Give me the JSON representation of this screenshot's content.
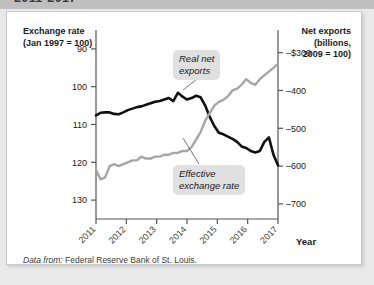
{
  "page": {
    "title_strip_text": "2011-2017",
    "background_color": "#e9e9e9",
    "card_color": "#ffffff"
  },
  "left_axis": {
    "title_line1": "Exchange rate",
    "title_line2": "(Jan 1997 = 100)",
    "ticks": [
      "130",
      "120",
      "110",
      "100",
      "90"
    ]
  },
  "right_axis": {
    "title_line1": "Net exports",
    "title_line2": "(billions,",
    "title_line3": "2009 = 100)",
    "ticks": [
      "–$300",
      "–400",
      "–500",
      "–600",
      "–700"
    ]
  },
  "x_axis": {
    "name": "Year",
    "ticks": [
      "2011",
      "2012",
      "2013",
      "2014",
      "2015",
      "2016",
      "2017"
    ]
  },
  "callouts": {
    "real_net_exports_line1": "Real net",
    "real_net_exports_line2": "exports",
    "effective_exchange_line1": "Effective",
    "effective_exchange_line2": "exchange rate"
  },
  "source": {
    "prefix": "Data from:",
    "text": "Federal Reserve Bank of St. Louis."
  },
  "colors": {
    "real_net_exports_line": "#111111",
    "effective_exchange_line": "#a6a6a6",
    "axis": "#555555",
    "callout_background": "#e0e0e0"
  },
  "chart_data": {
    "type": "line",
    "title": "2011-2017",
    "xlabel": "Year",
    "ylabel": "Exchange rate (Jan 1997 = 100)",
    "y2label": "Net exports (billions, 2009 = 100)",
    "grid": false,
    "legend": "annotations",
    "xlim": [
      2011,
      2017
    ],
    "ylim": [
      85,
      135
    ],
    "y2lim": [
      -740,
      -240
    ],
    "yticks": [
      90,
      100,
      110,
      120,
      130
    ],
    "y2ticks": [
      -300,
      -400,
      -500,
      -600,
      -700
    ],
    "xticks": [
      2011,
      2012,
      2013,
      2014,
      2015,
      2016,
      2017
    ],
    "series": [
      {
        "name": "Real net exports",
        "axis": "right",
        "color": "#111111",
        "units": "billions of dollars",
        "x": [
          2011.0,
          2011.15,
          2011.3,
          2011.45,
          2011.6,
          2011.75,
          2011.9,
          2012.05,
          2012.2,
          2012.35,
          2012.5,
          2012.65,
          2012.8,
          2012.95,
          2013.1,
          2013.25,
          2013.4,
          2013.55,
          2013.7,
          2013.85,
          2014.0,
          2014.15,
          2014.3,
          2014.45,
          2014.6,
          2014.75,
          2014.9,
          2015.05,
          2015.2,
          2015.35,
          2015.5,
          2015.65,
          2015.8,
          2015.95,
          2016.1,
          2016.25,
          2016.4,
          2016.55,
          2016.7,
          2016.85,
          2017.0
        ],
        "y": [
          -466,
          -459,
          -458,
          -458,
          -462,
          -463,
          -458,
          -452,
          -448,
          -444,
          -442,
          -438,
          -434,
          -430,
          -428,
          -424,
          -420,
          -428,
          -406,
          -416,
          -424,
          -420,
          -414,
          -418,
          -440,
          -470,
          -494,
          -512,
          -516,
          -522,
          -528,
          -536,
          -548,
          -552,
          -560,
          -564,
          -560,
          -536,
          -524,
          -570,
          -598
        ]
      },
      {
        "name": "Effective exchange rate",
        "axis": "left",
        "color": "#a6a6a6",
        "units": "index, Jan 1997 = 100",
        "x": [
          2011.0,
          2011.15,
          2011.3,
          2011.45,
          2011.6,
          2011.75,
          2011.9,
          2012.05,
          2012.2,
          2012.35,
          2012.5,
          2012.65,
          2012.8,
          2012.95,
          2013.1,
          2013.25,
          2013.4,
          2013.55,
          2013.7,
          2013.85,
          2014.0,
          2014.15,
          2014.3,
          2014.45,
          2014.6,
          2014.75,
          2014.9,
          2015.05,
          2015.2,
          2015.35,
          2015.5,
          2015.65,
          2015.8,
          2015.95,
          2016.1,
          2016.25,
          2016.4,
          2016.55,
          2016.7,
          2016.85,
          2017.0
        ],
        "y": [
          98.0,
          95.5,
          96.0,
          99.0,
          99.5,
          99.0,
          99.5,
          100.0,
          100.5,
          100.5,
          101.5,
          101.0,
          101.0,
          101.5,
          101.5,
          102.0,
          102.0,
          102.5,
          102.5,
          103.0,
          103.0,
          104.0,
          106.0,
          108.0,
          111.0,
          113.0,
          115.0,
          116.0,
          116.5,
          117.5,
          119.0,
          119.5,
          120.5,
          122.0,
          121.0,
          120.5,
          122.0,
          123.0,
          124.0,
          125.0,
          126.0
        ]
      }
    ],
    "annotations": [
      {
        "text": "Real net exports",
        "target_x": 2013.75,
        "target_series": "Real net exports"
      },
      {
        "text": "Effective exchange rate",
        "target_x": 2014.35,
        "target_series": "Effective exchange rate"
      }
    ]
  }
}
